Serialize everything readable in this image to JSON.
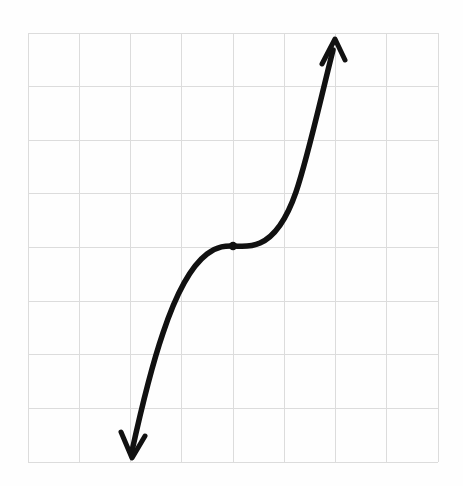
{
  "figure": {
    "background_color": "#fefefe",
    "width": 463,
    "height": 486
  },
  "grid": {
    "line_color": "#dcdcdc",
    "line_width": 1,
    "style": "solid-faint",
    "left": 28,
    "top": 33,
    "right": 438,
    "bottom": 462,
    "columns": 8,
    "rows": 8,
    "col_spacing": 51.25,
    "row_spacing": 53.625,
    "x_lines": [
      28,
      79.25,
      130.5,
      181.75,
      233,
      284.25,
      335.5,
      386.75,
      438
    ],
    "y_lines": [
      33,
      86.6,
      140.2,
      193.9,
      247.5,
      301.1,
      354.7,
      408.4,
      462
    ]
  },
  "curve": {
    "name": "cubic-curve",
    "color": "#111111",
    "stroke_width": 5.5,
    "path": "M 132 451 C 141 410, 150 371, 163 333 C 175 297, 190 267, 207 254 C 219 245, 228 246, 233 246 C 240 246, 249 248, 260 243 C 276 236, 287 218, 296 192 C 307 160, 318 110, 333 50",
    "description": "S-shaped cubic curve rising from lower-left to upper-right"
  },
  "inflection_point": {
    "name": "inflection-point",
    "cx": 233,
    "cy": 246,
    "radius": 4.2,
    "color": "#111111",
    "on_grid_intersection": true
  },
  "arrows": {
    "top": {
      "name": "arrow-head-top",
      "tip_x": 335,
      "tip_y": 39,
      "color": "#111111",
      "stroke_width": 5,
      "direction": "up-right",
      "path": "M 322 64 L 335 39 L 345 60"
    },
    "bottom": {
      "name": "arrow-head-bottom",
      "tip_x": 132,
      "tip_y": 458,
      "color": "#111111",
      "stroke_width": 5,
      "direction": "down-left",
      "path": "M 121 432 L 132 458 L 145 436"
    }
  },
  "chart_data": {
    "type": "line",
    "xlabel": "",
    "ylabel": "",
    "grid": true,
    "legend": null,
    "xlim": [
      -4,
      4
    ],
    "ylim": [
      -4,
      4
    ],
    "xticks": [
      -4,
      -3,
      -2,
      -1,
      0,
      1,
      2,
      3,
      4
    ],
    "yticks": [
      -4,
      -3,
      -2,
      -1,
      0,
      1,
      2,
      3,
      4
    ],
    "xticklabels": [
      "",
      "",
      "",
      "",
      "",
      "",
      "",
      "",
      ""
    ],
    "yticklabels": [
      "",
      "",
      "",
      "",
      "",
      "",
      "",
      "",
      ""
    ],
    "series": [
      {
        "name": "cubic",
        "equation": "y = x^3",
        "x": [
          -2.03,
          -1.8,
          -1.6,
          -1.4,
          -1.2,
          -1.0,
          -0.8,
          -0.6,
          -0.4,
          -0.2,
          0.0,
          0.2,
          0.4,
          0.6,
          0.8,
          1.0,
          1.2,
          1.4,
          1.6,
          1.8,
          2.0
        ],
        "y": [
          -3.84,
          -3.2,
          -2.6,
          -2.05,
          -1.55,
          -1.12,
          -0.74,
          -0.45,
          -0.24,
          -0.09,
          0.0,
          0.09,
          0.24,
          0.45,
          0.74,
          1.12,
          1.55,
          2.05,
          2.6,
          3.2,
          3.85
        ]
      }
    ],
    "annotations": [
      {
        "name": "inflection-point",
        "type": "point",
        "x": 0,
        "y": 0,
        "label": "",
        "marker": "filled-circle"
      },
      {
        "name": "arrow-head-top",
        "type": "arrowhead",
        "x": 2.0,
        "y": 3.85,
        "direction": "up"
      },
      {
        "name": "arrow-head-bottom",
        "type": "arrowhead",
        "x": -2.03,
        "y": -3.9,
        "direction": "down"
      }
    ]
  }
}
